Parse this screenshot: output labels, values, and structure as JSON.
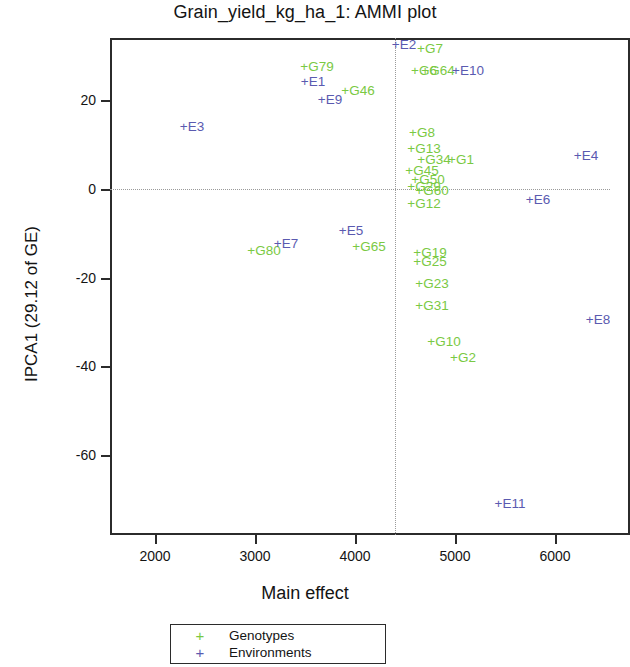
{
  "chart_data": {
    "type": "scatter",
    "title": "Grain_yield_kg_ha_1: AMMI plot",
    "xlabel": "Main effect",
    "ylabel": "IPCA1 (29.12 of GE)",
    "xlim": [
      1550,
      6750
    ],
    "ylim": [
      -78,
      34
    ],
    "xticks": [
      2000,
      3000,
      4000,
      5000,
      6000
    ],
    "yticks": [
      20,
      0,
      -20,
      -40,
      -60
    ],
    "grid": false,
    "reference_lines": {
      "vertical_x": 4400,
      "horizontal_y": 0,
      "style": "dotted"
    },
    "legend": {
      "position": "below-axis",
      "entries": [
        {
          "symbol": "+",
          "label": "Genotypes",
          "color": "#7ac943"
        },
        {
          "symbol": "+",
          "label": "Environments",
          "color": "#5a5ab0"
        }
      ]
    },
    "series": [
      {
        "name": "Genotypes",
        "color": "#7ac943",
        "points": [
          {
            "label": "G79",
            "x": 3490,
            "y": 27.5
          },
          {
            "label": "G7",
            "x": 4620,
            "y": 31.5
          },
          {
            "label": "G6",
            "x": 4560,
            "y": 26.5
          },
          {
            "label": "G64",
            "x": 4700,
            "y": 26.5
          },
          {
            "label": "G46",
            "x": 3900,
            "y": 22.0
          },
          {
            "label": "G8",
            "x": 4540,
            "y": 12.5
          },
          {
            "label": "G13",
            "x": 4560,
            "y": 9.0
          },
          {
            "label": "G34",
            "x": 4660,
            "y": 6.5
          },
          {
            "label": "G1",
            "x": 4930,
            "y": 6.5
          },
          {
            "label": "G45",
            "x": 4540,
            "y": 4.0
          },
          {
            "label": "G50",
            "x": 4600,
            "y": 2.0
          },
          {
            "label": "G29",
            "x": 4560,
            "y": 0.5
          },
          {
            "label": "G60",
            "x": 4640,
            "y": -0.5
          },
          {
            "label": "G12",
            "x": 4560,
            "y": -3.5
          },
          {
            "label": "G65",
            "x": 4010,
            "y": -13.0
          },
          {
            "label": "G80",
            "x": 2960,
            "y": -14.0
          },
          {
            "label": "G19",
            "x": 4620,
            "y": -14.5
          },
          {
            "label": "G25",
            "x": 4620,
            "y": -16.5
          },
          {
            "label": "G23",
            "x": 4640,
            "y": -21.5
          },
          {
            "label": "G31",
            "x": 4640,
            "y": -26.5
          },
          {
            "label": "G10",
            "x": 4760,
            "y": -34.5
          },
          {
            "label": "G2",
            "x": 4950,
            "y": -38.0
          }
        ]
      },
      {
        "name": "Environments",
        "color": "#5a5ab0",
        "points": [
          {
            "label": "E2",
            "x": 4360,
            "y": 32.5
          },
          {
            "label": "E10",
            "x": 5000,
            "y": 26.5
          },
          {
            "label": "E1",
            "x": 3450,
            "y": 24.0
          },
          {
            "label": "E9",
            "x": 3620,
            "y": 20.0
          },
          {
            "label": "E3",
            "x": 2240,
            "y": 14.0
          },
          {
            "label": "E4",
            "x": 6180,
            "y": 7.5
          },
          {
            "label": "E6",
            "x": 5700,
            "y": -2.5
          },
          {
            "label": "E5",
            "x": 3830,
            "y": -9.5
          },
          {
            "label": "E7",
            "x": 3180,
            "y": -12.5
          },
          {
            "label": "E8",
            "x": 6300,
            "y": -29.5
          },
          {
            "label": "E11",
            "x": 5420,
            "y": -71.0
          }
        ]
      }
    ]
  }
}
